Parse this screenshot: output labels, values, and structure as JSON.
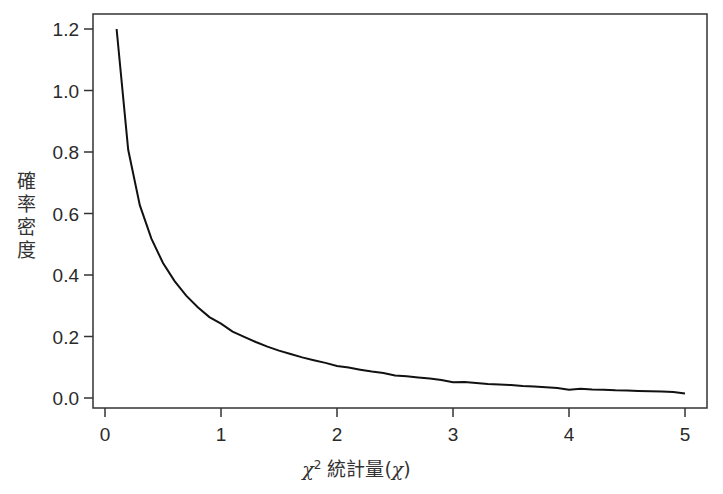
{
  "chart_data": {
    "type": "line",
    "title": "",
    "xlabel": "χ² 統計量(χ)",
    "xlabel_parts": {
      "chi": "χ",
      "sup": "2",
      "text": " 統計量(",
      "chi2": "χ",
      "close": ")"
    },
    "ylabel": "確率密度",
    "ylabel_chars": [
      "確",
      "率",
      "密",
      "度"
    ],
    "xlim": [
      0,
      5
    ],
    "ylim": [
      0.0,
      1.2
    ],
    "xticks": [
      0,
      1,
      2,
      3,
      4,
      5
    ],
    "xtick_labels": [
      "0",
      "1",
      "2",
      "3",
      "4",
      "5"
    ],
    "yticks": [
      0.0,
      0.2,
      0.4,
      0.6,
      0.8,
      1.0,
      1.2
    ],
    "ytick_labels": [
      "0.0",
      "0.2",
      "0.4",
      "0.6",
      "0.8",
      "1.0",
      "1.2"
    ],
    "grid": false,
    "legend": null,
    "series": [
      {
        "name": "chi-square density (df=1)",
        "color": "#111111",
        "x": [
          0.1,
          0.2,
          0.3,
          0.4,
          0.5,
          0.6,
          0.7,
          0.8,
          0.9,
          1.0,
          1.1,
          1.2,
          1.3,
          1.4,
          1.5,
          1.6,
          1.7,
          1.8,
          1.9,
          2.0,
          2.1,
          2.2,
          2.3,
          2.4,
          2.5,
          2.6,
          2.7,
          2.8,
          2.9,
          3.0,
          3.1,
          3.2,
          3.3,
          3.4,
          3.5,
          3.6,
          3.7,
          3.8,
          3.9,
          4.0,
          4.1,
          4.2,
          4.3,
          4.4,
          4.5,
          4.6,
          4.7,
          4.8,
          4.9,
          5.0
        ],
        "values": [
          1.2,
          0.807,
          0.627,
          0.518,
          0.439,
          0.38,
          0.333,
          0.295,
          0.263,
          0.242,
          0.216,
          0.199,
          0.182,
          0.167,
          0.154,
          0.143,
          0.132,
          0.123,
          0.114,
          0.104,
          0.099,
          0.092,
          0.086,
          0.081,
          0.073,
          0.071,
          0.067,
          0.063,
          0.059,
          0.051,
          0.052,
          0.049,
          0.046,
          0.044,
          0.042,
          0.039,
          0.037,
          0.035,
          0.033,
          0.027,
          0.03,
          0.028,
          0.027,
          0.025,
          0.024,
          0.023,
          0.022,
          0.021,
          0.02,
          0.015
        ]
      }
    ]
  },
  "colors": {
    "axis": "#333333",
    "line": "#111111",
    "background": "#ffffff"
  }
}
